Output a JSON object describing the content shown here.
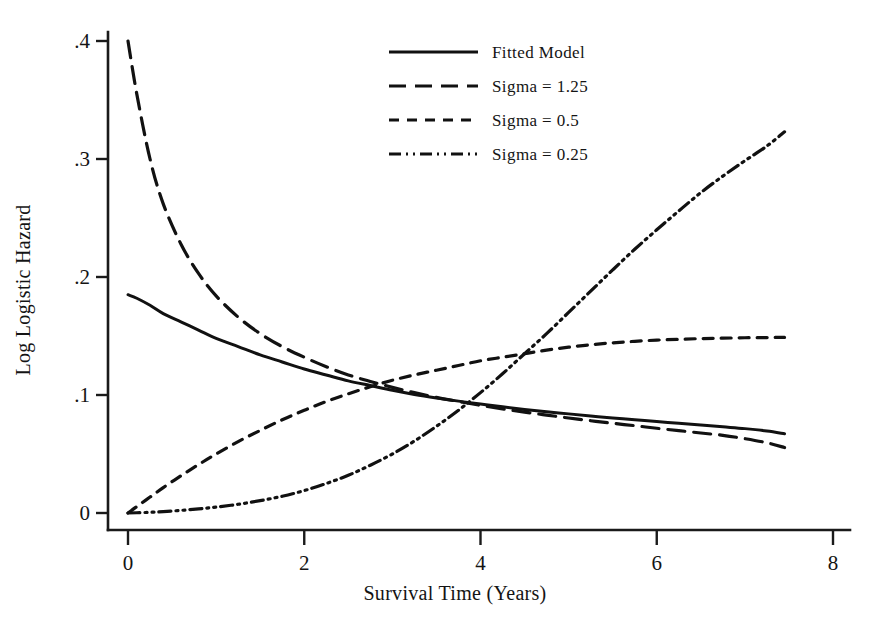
{
  "chart_data": {
    "type": "line",
    "title": "",
    "xlabel": "Survival Time (Years)",
    "ylabel": "Log Logistic Hazard",
    "xlim": [
      -0.25,
      8.25
    ],
    "ylim": [
      -0.012,
      0.425
    ],
    "xticks": [
      0,
      2,
      4,
      6,
      8
    ],
    "xticklabels": [
      "0",
      "2",
      "4",
      "6",
      "8"
    ],
    "yticks": [
      0,
      0.1,
      0.2,
      0.3,
      0.4
    ],
    "yticklabels": [
      "0",
      ".1",
      ".2",
      ".3",
      ".4"
    ],
    "grid": false,
    "legend_position": "top-center",
    "x": [
      0,
      0.1,
      0.25,
      0.4,
      0.6,
      0.8,
      1.0,
      1.25,
      1.5,
      1.75,
      2.0,
      2.25,
      2.5,
      2.75,
      3.0,
      3.25,
      3.5,
      3.75,
      4.0,
      4.25,
      4.5,
      4.75,
      5.0,
      5.25,
      5.5,
      5.75,
      6.0,
      6.25,
      6.5,
      6.75,
      7.0,
      7.25,
      7.45
    ],
    "series": [
      {
        "name": "Fitted Model",
        "style": "solid",
        "values": [
          0.185,
          0.182,
          0.176,
          0.169,
          0.162,
          0.155,
          0.148,
          0.141,
          0.134,
          0.128,
          0.122,
          0.117,
          0.112,
          0.108,
          0.104,
          0.1005,
          0.0975,
          0.0948,
          0.0923,
          0.09,
          0.0878,
          0.0858,
          0.084,
          0.0822,
          0.0806,
          0.079,
          0.0775,
          0.076,
          0.0745,
          0.073,
          0.0715,
          0.0695,
          0.0672
        ]
      },
      {
        "name": "Sigma = 1.25",
        "style": "long-dash",
        "values": [
          0.4,
          0.355,
          0.3,
          0.262,
          0.228,
          0.203,
          0.184,
          0.166,
          0.152,
          0.141,
          0.132,
          0.124,
          0.117,
          0.1115,
          0.1065,
          0.102,
          0.098,
          0.0945,
          0.0912,
          0.0882,
          0.0855,
          0.083,
          0.0805,
          0.0782,
          0.076,
          0.074,
          0.0718,
          0.0698,
          0.0678,
          0.0658,
          0.063,
          0.0595,
          0.0555
        ]
      },
      {
        "name": "Sigma = 0.5",
        "style": "short-dash",
        "values": [
          0.0,
          0.0055,
          0.0135,
          0.0215,
          0.0315,
          0.041,
          0.05,
          0.0605,
          0.07,
          0.079,
          0.087,
          0.0945,
          0.101,
          0.107,
          0.1125,
          0.117,
          0.121,
          0.125,
          0.129,
          0.132,
          0.135,
          0.138,
          0.1405,
          0.1425,
          0.1442,
          0.1455,
          0.1465,
          0.1472,
          0.1478,
          0.1482,
          0.1485,
          0.1487,
          0.1488
        ]
      },
      {
        "name": "Sigma = 0.25",
        "style": "dash-dot-dot",
        "values": [
          0.0,
          0.0002,
          0.0006,
          0.0012,
          0.0022,
          0.0035,
          0.005,
          0.0074,
          0.0105,
          0.0142,
          0.019,
          0.025,
          0.032,
          0.0405,
          0.05,
          0.061,
          0.0735,
          0.087,
          0.102,
          0.118,
          0.135,
          0.152,
          0.17,
          0.188,
          0.206,
          0.2235,
          0.24,
          0.256,
          0.2715,
          0.2855,
          0.2985,
          0.311,
          0.323
        ]
      }
    ]
  },
  "legend": {
    "items": [
      {
        "label": "Fitted Model",
        "style": "solid"
      },
      {
        "label": "Sigma = 1.25",
        "style": "long-dash"
      },
      {
        "label": "Sigma = 0.5",
        "style": "short-dash"
      },
      {
        "label": "Sigma = 0.25",
        "style": "dash-dot-dot"
      }
    ]
  },
  "colors": {
    "ink": "#111111",
    "background": "#ffffff"
  }
}
